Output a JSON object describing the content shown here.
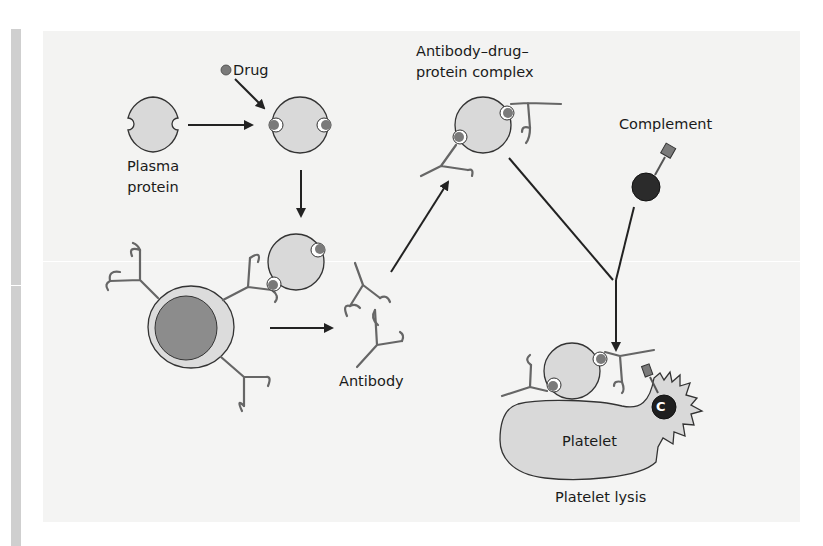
{
  "figure": {
    "labels": {
      "drug": "Drug",
      "plasma_protein_line1": "Plasma",
      "plasma_protein_line2": "protein",
      "complex_line1": "Antibody–drug–",
      "complex_line2": "protein complex",
      "complement": "Complement",
      "antibody": "Antibody",
      "platelet": "Platelet",
      "platelet_lysis": "Platelet lysis",
      "complement_marker": "C"
    },
    "nodes": [
      {
        "id": "drug",
        "label": "Drug"
      },
      {
        "id": "plasma-protein",
        "label": "Plasma protein"
      },
      {
        "id": "drug-protein",
        "label": ""
      },
      {
        "id": "b-cell",
        "label": ""
      },
      {
        "id": "antibody",
        "label": "Antibody"
      },
      {
        "id": "complex",
        "label": "Antibody–drug–protein complex"
      },
      {
        "id": "complement",
        "label": "Complement"
      },
      {
        "id": "platelet-lysis",
        "label": "Platelet lysis"
      }
    ],
    "edges": [
      {
        "from": "drug",
        "to": "drug-protein"
      },
      {
        "from": "plasma-protein",
        "to": "drug-protein"
      },
      {
        "from": "drug-protein",
        "to": "b-cell"
      },
      {
        "from": "b-cell",
        "to": "antibody"
      },
      {
        "from": "antibody",
        "to": "complex"
      },
      {
        "from": "complex",
        "to": "platelet-lysis"
      },
      {
        "from": "complement",
        "to": "platelet-lysis"
      }
    ],
    "colors": {
      "protein_fill": "#d9d9d9",
      "drug_fill": "#7a7a7a",
      "cell_nucleus": "#8c8c8c",
      "complement_fill": "#2b2b2b",
      "line": "#222222",
      "antibody_stroke": "#666666",
      "panel_bg": "#f3f3f2"
    }
  }
}
